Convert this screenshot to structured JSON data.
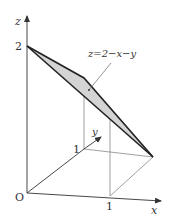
{
  "figure": {
    "equation_label": "z=2−x−y",
    "axes": {
      "x_label": "x",
      "y_label": "y",
      "z_label": "z",
      "origin_label": "O"
    },
    "ticks": {
      "z_tick": "2",
      "x_tick": "1",
      "y_tick": "1"
    },
    "colors": {
      "plane_fill": "#d4d4d4",
      "edge": "#333333",
      "guide": "#777777"
    }
  }
}
